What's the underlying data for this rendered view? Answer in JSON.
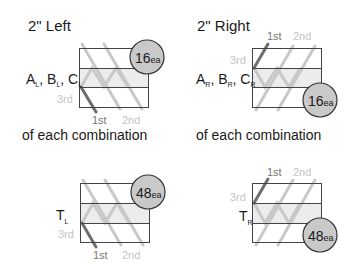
{
  "colors": {
    "frame": "#444444",
    "band": "#ececec",
    "stitch_light": "#c8c8c8",
    "stitch_dark": "#6e6e6e",
    "badge_fill": "#c9c9c9",
    "badge_stroke": "#333333",
    "label_mid": "#777777",
    "label_light": "#c4c4c4"
  },
  "panels": [
    {
      "id": "left-abc",
      "title": "2\" Left",
      "label_main": [
        "A",
        "B",
        "C"
      ],
      "label_sub": "L",
      "caption": "of each combination",
      "badge_num": "16",
      "badge_unit": "ea",
      "pass_labels": {
        "first": "1st",
        "second": "2nd",
        "third": "3rd"
      }
    },
    {
      "id": "right-abc",
      "title": "2\" Right",
      "label_main": [
        "A",
        "B",
        "C"
      ],
      "label_sub": "R",
      "caption": "of each combination",
      "badge_num": "16",
      "badge_unit": "ea",
      "pass_labels": {
        "first": "1st",
        "second": "2nd",
        "third": "3rd"
      }
    },
    {
      "id": "left-t",
      "label_main": [
        "T"
      ],
      "label_sub": "L",
      "badge_num": "48",
      "badge_unit": "ea",
      "pass_labels": {
        "first": "1st",
        "second": "2nd",
        "third": "3rd"
      }
    },
    {
      "id": "right-t",
      "label_main": [
        "T"
      ],
      "label_sub": "R",
      "badge_num": "48",
      "badge_unit": "ea",
      "pass_labels": {
        "first": "1st",
        "second": "2nd",
        "third": "3rd"
      }
    }
  ]
}
